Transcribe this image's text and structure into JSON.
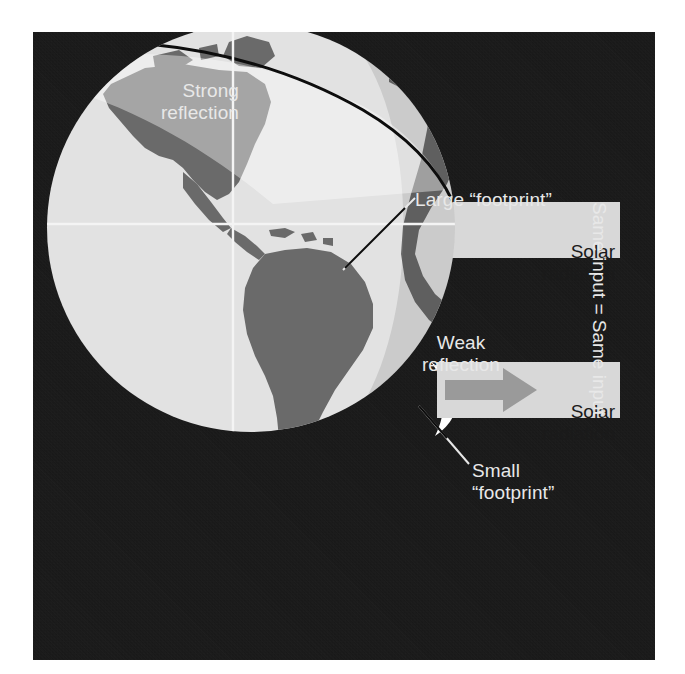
{
  "figure": {
    "panel_background_color": "#141414"
  },
  "colors": {
    "background": "#ffffff",
    "panel": "#141414",
    "ocean": "#e2e2e2",
    "land": "#6a6a6a",
    "beam_band": "#d8d8d8",
    "reflection_arrow": "#b4b4b4",
    "weak_arrow": "#9a9a9a",
    "gridline": "#f2f2f2",
    "label_text": "#e8e8e8",
    "beam_text": "#1a1a1a",
    "leader_line": "#e8e8e8",
    "footprint_arc": "#0d0d0d"
  },
  "labels": {
    "strong_reflection": "Strong\nreflection",
    "weak_reflection": "Weak\nreflection",
    "large_footprint": "Large “footprint”",
    "small_footprint": "Small\n“footprint”",
    "solar_radiation_top": "Solar\nradiation",
    "solar_radiation_bottom": "Solar\nradiation",
    "same_input": "Same input  =  Same input"
  },
  "diagram": {
    "globe": {
      "name": "Earth globe, Western Hemisphere",
      "center_x": 218,
      "center_y": 196,
      "radius": 204,
      "gridlines": [
        "equator",
        "prime-meridian"
      ]
    },
    "beams": [
      {
        "id": "oblique-beam",
        "label": "Solar radiation",
        "footprint": "Large “footprint”",
        "reflection": "Strong reflection",
        "angle_description": "oblique / high-latitude incidence",
        "band_top": 170,
        "band_bottom": 226
      },
      {
        "id": "direct-beam",
        "label": "Solar radiation",
        "footprint": "Small “footprint”",
        "reflection": "Weak reflection",
        "angle_description": "direct / equatorial incidence",
        "band_top": 330,
        "band_bottom": 386
      }
    ]
  }
}
